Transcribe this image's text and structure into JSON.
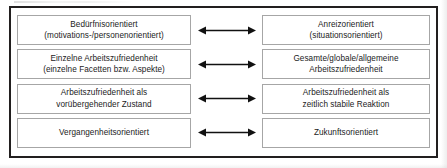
{
  "figure": {
    "frame_color": "#221f1f",
    "box_border_color": "#a6a6a6",
    "arrow_color": "#111111",
    "rows": [
      {
        "left": {
          "name": "beduerfnisorientiert",
          "lines": [
            "Bedürfnisorientiert",
            "(motivations-/personenorientiert)"
          ]
        },
        "arrow": {
          "icon": "double-headed-arrow-icon"
        },
        "right": {
          "name": "anreizorientiert",
          "lines": [
            "Anreizorientiert",
            "(situationsorientiert)"
          ]
        }
      },
      {
        "left": {
          "name": "einzelne-arbeitszufriedenheit",
          "lines": [
            "Einzelne Arbeitszufriedenheit",
            "(einzelne Facetten bzw. Aspekte)"
          ]
        },
        "arrow": {
          "icon": "double-headed-arrow-icon"
        },
        "right": {
          "name": "gesamte-arbeitszufriedenheit",
          "lines": [
            "Gesamte/globale/allgemeine",
            "Arbeitszufriedenheit"
          ]
        }
      },
      {
        "left": {
          "name": "voruebergehender-zustand",
          "lines": [
            "Arbeitszufriedenheit als",
            "vorübergehender Zustand"
          ]
        },
        "arrow": {
          "icon": "double-headed-arrow-icon"
        },
        "right": {
          "name": "zeitlich-stabile-reaktion",
          "lines": [
            "Arbeitszufriedenheit als",
            "zeitlich stabile Reaktion"
          ]
        }
      },
      {
        "left": {
          "name": "vergangenheitsorientiert",
          "lines": [
            "Vergangenheitsorientiert"
          ]
        },
        "arrow": {
          "icon": "double-headed-arrow-icon"
        },
        "right": {
          "name": "zukunftsorientiert",
          "lines": [
            "Zukunftsorientiert"
          ]
        }
      }
    ]
  }
}
